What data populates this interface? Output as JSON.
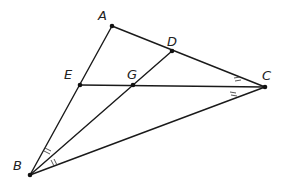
{
  "diagram": {
    "type": "geometry-triangle",
    "points": {
      "A": {
        "label": "A",
        "x": 112,
        "y": 26
      },
      "B": {
        "label": "B",
        "x": 30,
        "y": 175
      },
      "C": {
        "label": "C",
        "x": 265,
        "y": 87
      },
      "D": {
        "label": "D",
        "x": 172,
        "y": 51
      },
      "E": {
        "label": "E",
        "x": 80,
        "y": 85
      },
      "G": {
        "label": "G",
        "x": 133,
        "y": 85
      }
    },
    "segments": [
      "AB",
      "AC",
      "BC",
      "BD",
      "EC"
    ],
    "angle_marks": [
      {
        "vertex": "C",
        "between": [
          "CA",
          "CE"
        ],
        "ticks": 2
      },
      {
        "vertex": "C",
        "between": [
          "CE",
          "CB"
        ],
        "ticks": 2
      },
      {
        "vertex": "B",
        "between": [
          "BA",
          "BD"
        ],
        "ticks": 2
      },
      {
        "vertex": "B",
        "between": [
          "BD",
          "BC"
        ],
        "ticks": 2
      }
    ]
  }
}
